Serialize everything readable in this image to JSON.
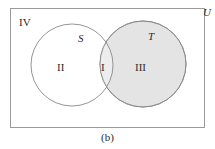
{
  "figure": {
    "caption": "(b)",
    "type": "venn-diagram",
    "universe_label": "U",
    "sets": [
      {
        "id": "S",
        "label": "S",
        "shaded": false
      },
      {
        "id": "T",
        "label": "T",
        "shaded": true
      }
    ],
    "regions": [
      {
        "id": "intersection",
        "label": "I",
        "description": "S and T",
        "shaded": true
      },
      {
        "id": "s-only",
        "label": "II",
        "description": "S only",
        "shaded": false
      },
      {
        "id": "t-only",
        "label": "III",
        "description": "T only",
        "shaded": true
      },
      {
        "id": "outside",
        "label": "IV",
        "description": "outside both sets",
        "shaded": false
      }
    ]
  },
  "colors": {
    "stroke": "#8a8a8a",
    "rect_stroke": "#9a9a9a",
    "shade_fill": "#e4e4e4",
    "intersection_fill": "#ededed",
    "text": "#2b2b2b",
    "background": "#ffffff"
  },
  "geometry": {
    "rect": {
      "x": 10,
      "y": 8,
      "width": 195,
      "height": 120
    },
    "circle_s": {
      "cx": 72,
      "cy": 65,
      "r": 41
    },
    "circle_t": {
      "cx": 143,
      "cy": 64,
      "r": 43
    }
  }
}
